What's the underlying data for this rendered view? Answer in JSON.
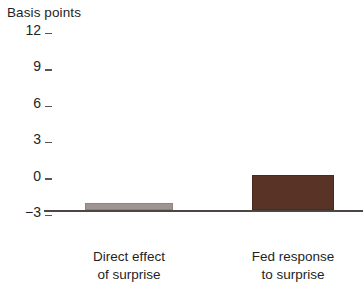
{
  "chart_data": {
    "type": "bar",
    "title": "Basis points",
    "xlabel": "",
    "ylabel": "Basis points",
    "categories": [
      "Direct effect of surprise",
      "Fed response to surprise"
    ],
    "category_lines": [
      [
        "Direct effect",
        "of surprise"
      ],
      [
        "Fed response",
        "to surprise"
      ]
    ],
    "values": [
      0.6,
      2.9
    ],
    "ylim": [
      -3,
      12
    ],
    "yticks": [
      12,
      9,
      6,
      3,
      0,
      -3
    ],
    "ytick_labels": [
      "12",
      "9",
      "6",
      "3",
      "0",
      "−3"
    ],
    "grid": false,
    "legend": "none",
    "colors": {
      "bar_direct": "#9e9492",
      "bar_fed": "#5a3327",
      "axis": "#4c4644",
      "text": "#231f1e"
    }
  }
}
